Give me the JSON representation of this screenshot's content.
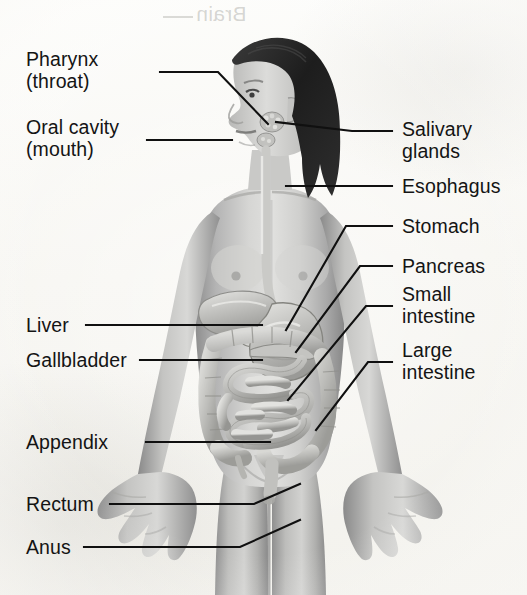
{
  "figure": {
    "background_color": "#fbfaf7",
    "text_color": "#141414",
    "line_color": "#101010",
    "artwork_style": "grayscale halftone medical illustration"
  },
  "artifact": {
    "bleed_through_text": "Brain",
    "note": "mirrored show-through text from reverse of page"
  },
  "labels": {
    "pharynx": {
      "text": "Pharynx\n(throat)",
      "side": "left"
    },
    "oral_cavity": {
      "text": "Oral cavity\n(mouth)",
      "side": "left"
    },
    "liver": {
      "text": "Liver",
      "side": "left"
    },
    "gallbladder": {
      "text": "Gallbladder",
      "side": "left"
    },
    "appendix": {
      "text": "Appendix",
      "side": "left"
    },
    "rectum": {
      "text": "Rectum",
      "side": "left"
    },
    "anus": {
      "text": "Anus",
      "side": "left"
    },
    "salivary_glands": {
      "text": "Salivary\nglands",
      "side": "right"
    },
    "esophagus": {
      "text": "Esophagus",
      "side": "right"
    },
    "stomach": {
      "text": "Stomach",
      "side": "right"
    },
    "pancreas": {
      "text": "Pancreas",
      "side": "right"
    },
    "small_intestine": {
      "text": "Small\nintestine",
      "side": "right"
    },
    "large_intestine": {
      "text": "Large\nintestine",
      "side": "right"
    }
  }
}
